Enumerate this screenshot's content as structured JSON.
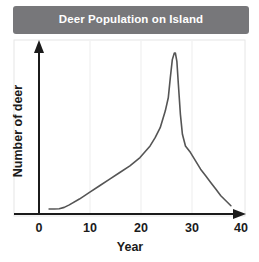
{
  "chart_data": {
    "type": "line",
    "title": "Deer Population on Island",
    "xlabel": "Year",
    "ylabel": "Number of deer",
    "xlim": [
      0,
      40
    ],
    "ylim": [
      0,
      100
    ],
    "xticks": [
      "0",
      "10",
      "20",
      "30",
      "40"
    ],
    "xtick_values": [
      0,
      10,
      20,
      30,
      40
    ],
    "yticks": [
      "0"
    ],
    "ytick_values": [
      0
    ],
    "grid": "vertical-faint",
    "legend": "none",
    "series": [
      {
        "name": "Deer population",
        "color": "#555555",
        "x": [
          2,
          3,
          4,
          5,
          6,
          8,
          10,
          12,
          14,
          16,
          18,
          20,
          22,
          23,
          24,
          25,
          25.6,
          26,
          26.4,
          26.8,
          27,
          27.3,
          27.6,
          28,
          28.4,
          29,
          29.5,
          30,
          31,
          32,
          33,
          34,
          35,
          36,
          37,
          38
        ],
        "y": [
          3,
          3,
          3.2,
          4,
          5.5,
          9,
          13,
          17,
          21,
          25,
          29,
          34,
          41,
          46,
          52,
          62,
          70,
          82,
          93,
          97,
          97,
          92,
          78,
          60,
          48,
          41,
          39,
          37,
          32,
          27,
          23,
          19,
          15,
          11,
          8,
          5
        ]
      }
    ]
  }
}
